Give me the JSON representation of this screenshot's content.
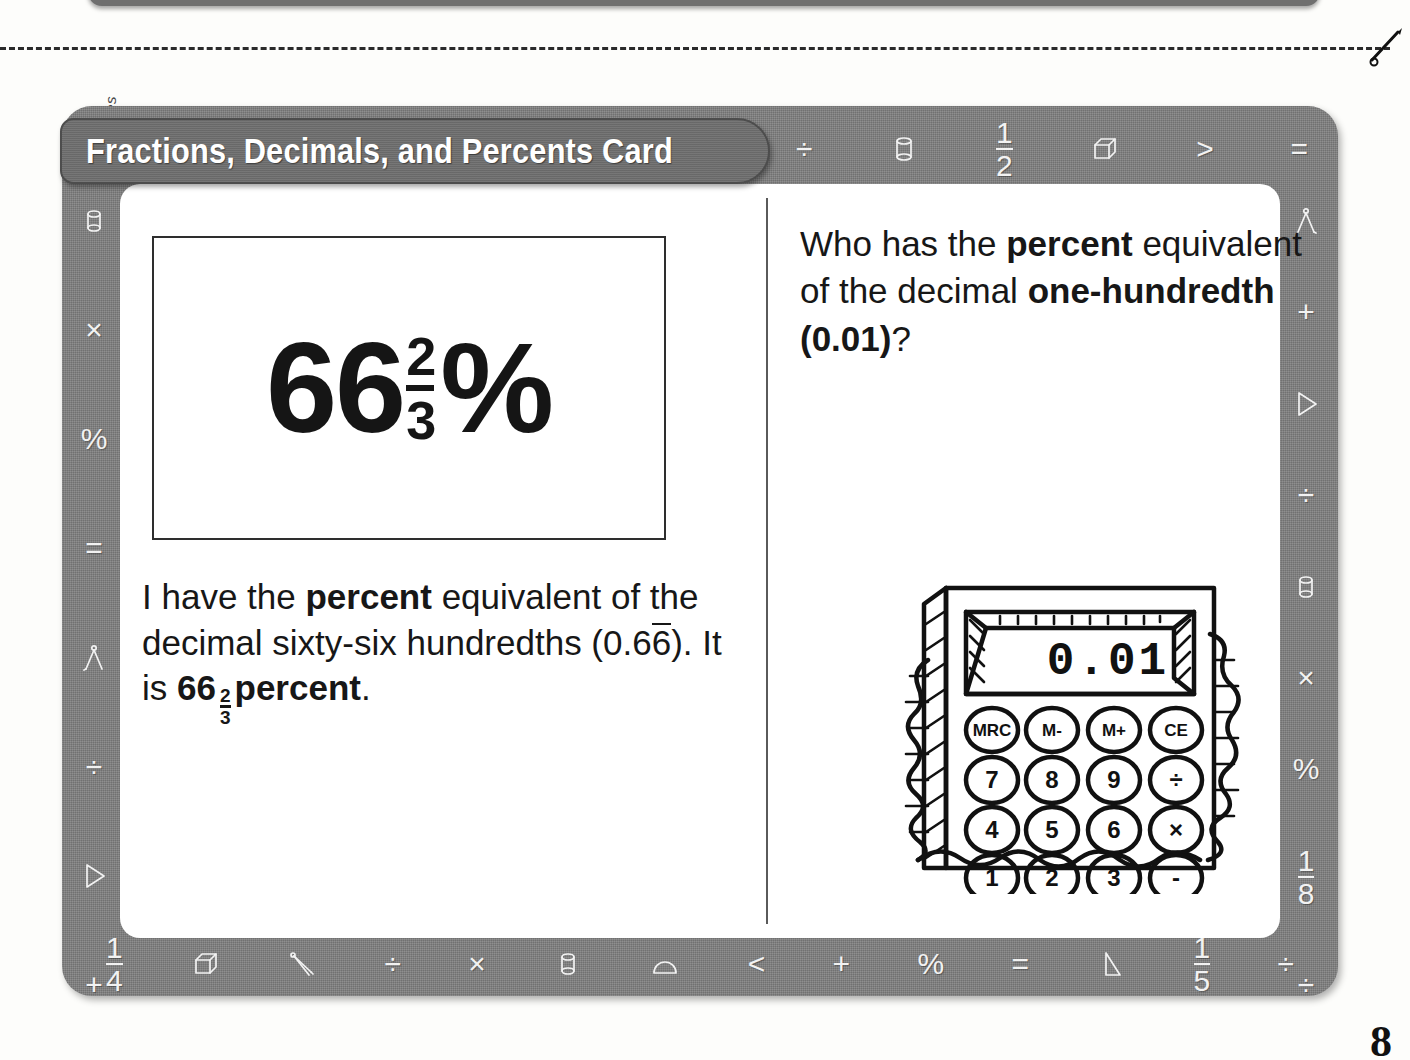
{
  "page": {
    "copyright": "Ask & Answer Interactive Math Practice: Grades 4-6 © 2007 by Joseph A. Porzio, Scholastic Teaching Resources",
    "page_number": "8"
  },
  "card": {
    "title": "Fractions, Decimals, and Percents Card",
    "answer": {
      "whole": "66",
      "fraction_numerator": "2",
      "fraction_denominator": "3",
      "unit": "%"
    },
    "statement": {
      "line1_plain": "I have the ",
      "line1_bold": "percent",
      "line2": "equivalent of the decimal",
      "line3_plain_a": "sixty-six hundredths (0.6",
      "line3_overline": "6",
      "line3_plain_b": ").",
      "line4_plain_a": "It is ",
      "line4_bold_whole": "66",
      "line4_frac_num": "2",
      "line4_frac_den": "3",
      "line4_bold_unit": "percent",
      "line4_plain_b": "."
    },
    "question": {
      "plain_a": "Who has the ",
      "bold_a": "percent",
      "plain_b": " equivalent of the decimal ",
      "bold_b": "one-hundredth (0.01)",
      "plain_c": "?"
    },
    "calculator": {
      "display_value": "0.01",
      "keys_row_memory": [
        "MRC",
        "M-",
        "M+",
        "CE"
      ],
      "keys_row_7": [
        "7",
        "8",
        "9",
        "÷"
      ],
      "keys_row_4": [
        "4",
        "5",
        "6",
        "×"
      ],
      "keys_row_1": [
        "1",
        "2",
        "3",
        "-"
      ]
    },
    "border_icons": {
      "top": [
        {
          "name": "divide-icon",
          "glyph": "÷"
        },
        {
          "name": "cylinder-icon",
          "glyph": "shape-cylinder"
        },
        {
          "name": "one-half-fraction-icon",
          "num": "1",
          "den": "2"
        },
        {
          "name": "cube-icon",
          "glyph": "shape-cube"
        },
        {
          "name": "greater-than-icon",
          "glyph": ">"
        },
        {
          "name": "equals-icon",
          "glyph": "="
        }
      ],
      "left": [
        {
          "name": "cylinder-icon",
          "glyph": "shape-cylinder"
        },
        {
          "name": "multiply-icon",
          "glyph": "×"
        },
        {
          "name": "percent-icon",
          "glyph": "%"
        },
        {
          "name": "equals-icon",
          "glyph": "="
        },
        {
          "name": "compass-icon",
          "glyph": "shape-compass"
        },
        {
          "name": "divide-icon",
          "glyph": "÷"
        },
        {
          "name": "cone-icon",
          "glyph": "shape-cone"
        },
        {
          "name": "plus-icon",
          "glyph": "+"
        }
      ],
      "right": [
        {
          "name": "compass-icon",
          "glyph": "shape-compass"
        },
        {
          "name": "plus-icon",
          "glyph": "+"
        },
        {
          "name": "cone-icon",
          "glyph": "shape-cone"
        },
        {
          "name": "divide-icon",
          "glyph": "÷"
        },
        {
          "name": "cylinder-icon",
          "glyph": "shape-cylinder"
        },
        {
          "name": "multiply-icon",
          "glyph": "×"
        },
        {
          "name": "percent-icon",
          "glyph": "%"
        },
        {
          "name": "one-eighth-fraction-icon",
          "num": "1",
          "den": "8"
        },
        {
          "name": "divide-icon",
          "glyph": "÷"
        }
      ],
      "bottom": [
        {
          "name": "one-quarter-fraction-icon",
          "num": "1",
          "den": "4"
        },
        {
          "name": "cube-icon",
          "glyph": "shape-cube"
        },
        {
          "name": "compass-icon",
          "glyph": "shape-compass"
        },
        {
          "name": "divide-icon",
          "glyph": "÷"
        },
        {
          "name": "multiply-icon",
          "glyph": "×"
        },
        {
          "name": "cylinder-icon",
          "glyph": "shape-cylinder"
        },
        {
          "name": "protractor-icon",
          "glyph": "shape-protractor"
        },
        {
          "name": "less-than-icon",
          "glyph": "<"
        },
        {
          "name": "plus-icon",
          "glyph": "+"
        },
        {
          "name": "percent-icon",
          "glyph": "%"
        },
        {
          "name": "equals-icon",
          "glyph": "="
        },
        {
          "name": "cone-icon",
          "glyph": "shape-cone"
        },
        {
          "name": "one-fifth-fraction-icon",
          "num": "1",
          "den": "5"
        },
        {
          "name": "divide-icon",
          "glyph": "÷"
        }
      ]
    }
  },
  "colors": {
    "card_border_gray": "#7d7d7d",
    "title_banner_gray": "#6e6e6e",
    "card_face_white": "#ffffff",
    "ink_black": "#171717"
  }
}
